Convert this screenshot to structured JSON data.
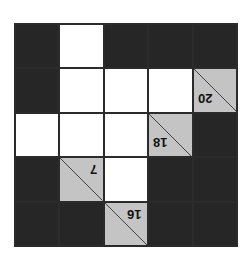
{
  "puzzle": {
    "type": "kakuro",
    "orientation": "rotated-180",
    "rows": 5,
    "cols": 5,
    "colors": {
      "black": "#262626",
      "white": "#ffffff",
      "clue": "#c4c4c4",
      "line": "#2b2b2b"
    },
    "grid": [
      [
        {
          "t": "black"
        },
        {
          "t": "white"
        },
        {
          "t": "black"
        },
        {
          "t": "black"
        },
        {
          "t": "black"
        }
      ],
      [
        {
          "t": "black"
        },
        {
          "t": "white"
        },
        {
          "t": "white"
        },
        {
          "t": "white"
        },
        {
          "t": "clue",
          "value": "20"
        }
      ],
      [
        {
          "t": "white"
        },
        {
          "t": "white"
        },
        {
          "t": "white"
        },
        {
          "t": "clue",
          "value": "18"
        },
        {
          "t": "black"
        }
      ],
      [
        {
          "t": "black"
        },
        {
          "t": "clue",
          "value": "7"
        },
        {
          "t": "white"
        },
        {
          "t": "black"
        },
        {
          "t": "black"
        }
      ],
      [
        {
          "t": "black"
        },
        {
          "t": "black"
        },
        {
          "t": "clue",
          "value": "16"
        },
        {
          "t": "black"
        },
        {
          "t": "black"
        }
      ]
    ],
    "clues": {
      "r1c4": "20",
      "r2c3": "18",
      "r3c1": "7",
      "r4c2": "16"
    }
  }
}
